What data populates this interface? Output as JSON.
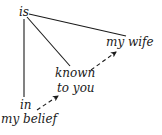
{
  "diagram": {
    "type": "dependency-tree",
    "nodes": [
      {
        "id": "is",
        "label": "is"
      },
      {
        "id": "my-wife",
        "label": "my wife"
      },
      {
        "id": "known",
        "label": "known"
      },
      {
        "id": "to-you",
        "label": "to you"
      },
      {
        "id": "in",
        "label": "in"
      },
      {
        "id": "my-belief",
        "label": "my belief"
      }
    ],
    "edges": [
      {
        "from": "is",
        "to": "my wife",
        "style": "solid"
      },
      {
        "from": "is",
        "to": "known",
        "style": "solid"
      },
      {
        "from": "is",
        "to": "in",
        "style": "solid"
      },
      {
        "from": "my belief",
        "to": "to you",
        "style": "dashed-arrow"
      },
      {
        "from": "known",
        "to": "my wife",
        "style": "dashed-arrow"
      }
    ],
    "colors": {
      "ink": "#1a1a1a",
      "background": "#ffffff"
    }
  }
}
